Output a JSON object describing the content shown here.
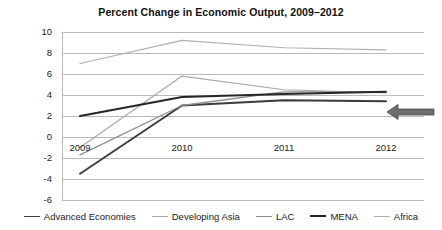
{
  "chart_data": {
    "type": "line",
    "title": "Percent Change in Economic Output, 2009–2012",
    "xlabel": "",
    "ylabel": "",
    "categories": [
      "2009",
      "2010",
      "2011",
      "2012"
    ],
    "x": [
      2009,
      2010,
      2011,
      2012
    ],
    "ylim": [
      -6,
      10
    ],
    "yticks": [
      10,
      8,
      6,
      4,
      2,
      0,
      -2,
      -4,
      -6
    ],
    "ytick_labels": [
      "10",
      "8",
      "6",
      "4",
      "2",
      "0",
      "-2",
      "-4",
      "-6"
    ],
    "grid": true,
    "legend_position": "bottom",
    "series": [
      {
        "name": "Advanced Economies",
        "values": [
          -3.5,
          3.0,
          3.5,
          3.4
        ],
        "color": "#3b3b3b",
        "width": 1.9
      },
      {
        "name": "Developing Asia",
        "values": [
          -1.0,
          5.8,
          4.5,
          4.2
        ],
        "color": "#a8a8a8",
        "width": 1.2
      },
      {
        "name": "LAC",
        "values": [
          -1.7,
          3.0,
          4.3,
          4.3
        ],
        "color": "#8c8c8c",
        "width": 1.3
      },
      {
        "name": "MENA",
        "values": [
          2.0,
          3.8,
          4.1,
          4.3
        ],
        "color": "#262626",
        "width": 2.0
      },
      {
        "name": "Africa",
        "values": [
          7.0,
          9.2,
          8.5,
          8.3
        ],
        "color": "#b0b0b0",
        "width": 1.2
      }
    ],
    "annotations": [
      {
        "type": "arrow",
        "direction": "left",
        "points_to_year": "2012",
        "points_to_value": 2.9,
        "color": "#6e6e6e"
      }
    ]
  },
  "axes": {
    "grid_color": "#b9b9b9",
    "tick_label_color": "#222222"
  }
}
